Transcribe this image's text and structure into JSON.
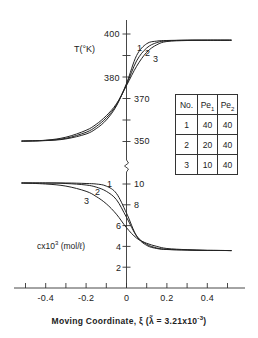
{
  "chart_data": [
    {
      "type": "line",
      "title": "",
      "panel": "temperature",
      "xlabel": "Moving Coordinate, ξ (λ̃ = 3.21x10⁻³)",
      "ylabel": "T(°K)",
      "xlim": [
        -0.5,
        0.5
      ],
      "ylim": [
        345,
        405
      ],
      "y_ticks_labeled": [
        400,
        380,
        370,
        350
      ],
      "y_ticks_all": [
        400,
        390,
        380,
        370,
        360,
        350
      ],
      "grid": false,
      "x": [
        -0.52,
        -0.4,
        -0.3,
        -0.2,
        -0.15,
        -0.1,
        -0.05,
        0,
        0.05,
        0.1,
        0.15,
        0.2,
        0.3,
        0.4,
        0.52
      ],
      "series": [
        {
          "name": "1",
          "values": [
            350.2,
            350.4,
            351.2,
            353.5,
            356.0,
            360.0,
            366.5,
            377.0,
            390.0,
            395.5,
            396.7,
            397.0,
            397.1,
            397.1,
            397.1
          ]
        },
        {
          "name": "2",
          "values": [
            350.2,
            350.5,
            351.5,
            354.3,
            357.0,
            361.0,
            367.0,
            376.5,
            387.5,
            393.5,
            396.0,
            396.8,
            397.1,
            397.1,
            397.1
          ]
        },
        {
          "name": "3",
          "values": [
            350.2,
            350.6,
            352.0,
            355.2,
            358.0,
            362.0,
            367.5,
            376.0,
            385.0,
            391.5,
            395.0,
            396.5,
            397.0,
            397.1,
            397.1
          ]
        }
      ]
    },
    {
      "type": "line",
      "title": "",
      "panel": "concentration",
      "xlabel": "Moving Coordinate, ξ (λ̃ = 3.21x10⁻³)",
      "ylabel": "cx10³ (mol/ℓ)",
      "xlim": [
        -0.5,
        0.5
      ],
      "ylim": [
        0,
        11
      ],
      "y_ticks_labeled": [
        10,
        8,
        6,
        4,
        2
      ],
      "x_ticks_labeled": [
        -0.4,
        -0.2,
        0,
        0.2,
        0.4
      ],
      "x_ticks_all": [
        -0.5,
        -0.4,
        -0.3,
        -0.2,
        -0.1,
        0,
        0.1,
        0.2,
        0.3,
        0.4,
        0.5
      ],
      "grid": false,
      "x": [
        -0.52,
        -0.4,
        -0.3,
        -0.2,
        -0.15,
        -0.1,
        -0.05,
        0,
        0.05,
        0.1,
        0.15,
        0.2,
        0.3,
        0.4,
        0.52
      ],
      "series": [
        {
          "name": "1",
          "values": [
            10.1,
            10.1,
            10.1,
            10.05,
            10.0,
            9.8,
            9.1,
            7.2,
            5.0,
            4.1,
            3.8,
            3.7,
            3.65,
            3.62,
            3.6
          ]
        },
        {
          "name": "2",
          "values": [
            10.1,
            10.1,
            10.05,
            9.9,
            9.7,
            9.3,
            8.5,
            6.8,
            5.0,
            4.2,
            3.85,
            3.72,
            3.65,
            3.62,
            3.6
          ]
        },
        {
          "name": "3",
          "values": [
            10.1,
            10.0,
            9.8,
            9.3,
            8.8,
            8.1,
            7.1,
            5.8,
            4.8,
            4.3,
            4.0,
            3.8,
            3.68,
            3.62,
            3.6
          ]
        }
      ]
    }
  ],
  "labels": {
    "t_axis_title": "T(°K)",
    "c_axis_title_main": "cx10",
    "c_axis_title_sup": "3",
    "c_axis_title_unit": " (mol/ℓ)",
    "t_ticks": [
      {
        "value": "400",
        "y": 34
      },
      {
        "value": "380",
        "y": 78
      },
      {
        "value": "370",
        "y": 99
      },
      {
        "value": "350",
        "y": 141
      }
    ],
    "c_ticks": [
      {
        "value": "10",
        "y": 184
      },
      {
        "value": "8",
        "y": 205
      },
      {
        "value": "6",
        "y": 226
      },
      {
        "value": "4",
        "y": 247
      },
      {
        "value": "2",
        "y": 268
      }
    ],
    "x_ticks": [
      "-0.4",
      "-0.2",
      "0",
      "0.2",
      "0.4"
    ],
    "x_label_main": "Moving Coordinate, ξ (",
    "x_label_lambda": "λ̃",
    "x_label_eq": " = 3.21x10",
    "x_label_sup": "-3",
    "x_label_close": ")",
    "curve_numbers_t": [
      "1",
      "2",
      "3"
    ],
    "curve_numbers_c": [
      "1",
      "2",
      "3"
    ]
  },
  "table": {
    "headers": [
      "No.",
      "Pe",
      "Pe"
    ],
    "header_subs": [
      "",
      "1",
      "2"
    ],
    "rows": [
      [
        "1",
        "40",
        "40"
      ],
      [
        "2",
        "20",
        "40"
      ],
      [
        "3",
        "10",
        "40"
      ]
    ]
  },
  "colors": {
    "line": "#222222",
    "axis": "#333333",
    "background": "#ffffff"
  }
}
